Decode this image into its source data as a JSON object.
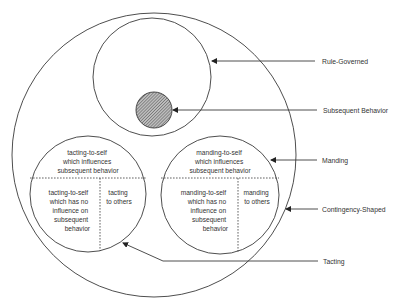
{
  "diagram": {
    "labels": {
      "rule_governed": "Rule-Governed",
      "subsequent_behavior": "Subsequent Behavior",
      "manding": "Manding",
      "contingency_shaped": "Contingency-Shaped",
      "tacting": "Tacting"
    },
    "tacting_circle": {
      "top": [
        "tacting-to-self",
        "which influences",
        "subsequent behavior"
      ],
      "bottom_left": [
        "tacting-to-self",
        "which has no",
        "influence on",
        "subsequent",
        "behavior"
      ],
      "bottom_right": [
        "tacting",
        "to others"
      ]
    },
    "manding_circle": {
      "top": [
        "manding-to-self",
        "which influences",
        "subsequent behavior"
      ],
      "bottom_left": [
        "manding-to-self",
        "which has no",
        "influence on",
        "subsequent",
        "behavior"
      ],
      "bottom_right": [
        "manding",
        "to others"
      ]
    },
    "colors": {
      "line": "#3a3a3a",
      "hatch_fill": "#9a9a9a",
      "text": "#333333",
      "background": "#ffffff"
    }
  }
}
